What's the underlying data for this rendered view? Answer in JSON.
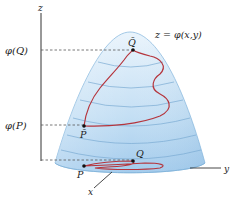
{
  "figure": {
    "surface_label": "z = φ(x,y)",
    "axes": {
      "z_label": "z",
      "x_label": "x",
      "y_label": "y"
    },
    "levels": {
      "phi_Q_label": "φ(Q)",
      "phi_P_label": "φ(P)"
    },
    "points": {
      "Q_bar": "Q̄",
      "P_bar": "P̄",
      "Q": "Q",
      "P": "P"
    },
    "colors": {
      "surface_top": "#e6f2fb",
      "surface_bottom": "#a9cfee",
      "surface_edge": "#7fb2d9",
      "contour": "#6fa3cf",
      "curve": "#b5343c",
      "axis": "#333333",
      "dash": "#555555"
    }
  }
}
